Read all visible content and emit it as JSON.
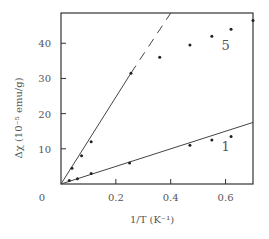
{
  "chart_data": {
    "type": "scatter",
    "title": "",
    "xlabel": "1/T (K⁻¹)",
    "ylabel": "Δχ (10⁻⁵ emu/g)",
    "xlim": [
      0,
      0.7
    ],
    "ylim": [
      0,
      48.6
    ],
    "xticks": [
      0.2,
      0.4,
      0.6
    ],
    "xtick_labels": [
      "0.2",
      "0.4",
      "0.6"
    ],
    "yticks": [
      10,
      20,
      30,
      40
    ],
    "ytick_labels": [
      "10",
      "20",
      "30",
      "40"
    ],
    "origin_label": "0",
    "grid": false,
    "legend": "inline labels",
    "series": [
      {
        "name": "5",
        "points": [
          {
            "x": 0.04,
            "y": 4.5
          },
          {
            "x": 0.075,
            "y": 8.0
          },
          {
            "x": 0.11,
            "y": 12.0
          },
          {
            "x": 0.255,
            "y": 31.5
          },
          {
            "x": 0.36,
            "y": 36.0
          },
          {
            "x": 0.47,
            "y": 39.5
          },
          {
            "x": 0.55,
            "y": 42.0
          },
          {
            "x": 0.62,
            "y": 44.0
          },
          {
            "x": 0.7,
            "y": 46.5
          }
        ],
        "fit_line": {
          "solid": [
            [
              0,
              0
            ],
            [
              0.255,
              31.5
            ]
          ],
          "dashed": [
            [
              0.255,
              31.5
            ],
            [
              0.4,
              48.6
            ]
          ]
        },
        "label_position": {
          "x": 0.6,
          "y": 38.0
        }
      },
      {
        "name": "1",
        "points": [
          {
            "x": 0.03,
            "y": 1.0
          },
          {
            "x": 0.06,
            "y": 1.5
          },
          {
            "x": 0.11,
            "y": 3.0
          },
          {
            "x": 0.25,
            "y": 6.0
          },
          {
            "x": 0.47,
            "y": 11.0
          },
          {
            "x": 0.55,
            "y": 12.5
          },
          {
            "x": 0.62,
            "y": 13.5
          }
        ],
        "fit_line": {
          "solid": [
            [
              0,
              0
            ],
            [
              0.7,
              17.5
            ]
          ]
        },
        "label_position": {
          "x": 0.6,
          "y": 9.5
        }
      }
    ]
  },
  "colors": {
    "axis": "#333333",
    "line": "#444444",
    "text": "#555555",
    "marker": "#222222"
  }
}
